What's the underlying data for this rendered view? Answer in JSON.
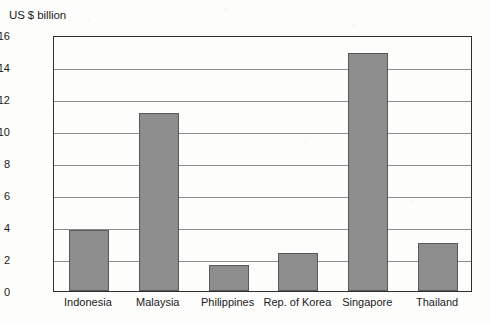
{
  "chart_data": {
    "type": "bar",
    "title": "",
    "ylabel": "US $ billion",
    "xlabel": "",
    "categories": [
      "Indonesia",
      "Malaysia",
      "Philippines",
      "Rep. of Korea",
      "Singapore",
      "Thailand"
    ],
    "values": [
      3.8,
      11.1,
      1.6,
      2.4,
      14.9,
      3.0
    ],
    "ylim": [
      0,
      16
    ],
    "yticks": [
      0,
      2,
      4,
      6,
      8,
      10,
      12,
      14,
      16
    ],
    "ytick_labels": [
      "0",
      "2",
      "4",
      "6",
      "8",
      "10",
      "12",
      "14",
      "16"
    ],
    "grid": true,
    "grid_axis": "y",
    "legend": null,
    "bar_color": "#8d8d8d",
    "bar_edge_color": "#595959",
    "axis_color": "#2e2e2e",
    "grid_color": "#8d8d8d",
    "background_color": "#fdfdfc",
    "text_color": "#1b1b1b"
  }
}
